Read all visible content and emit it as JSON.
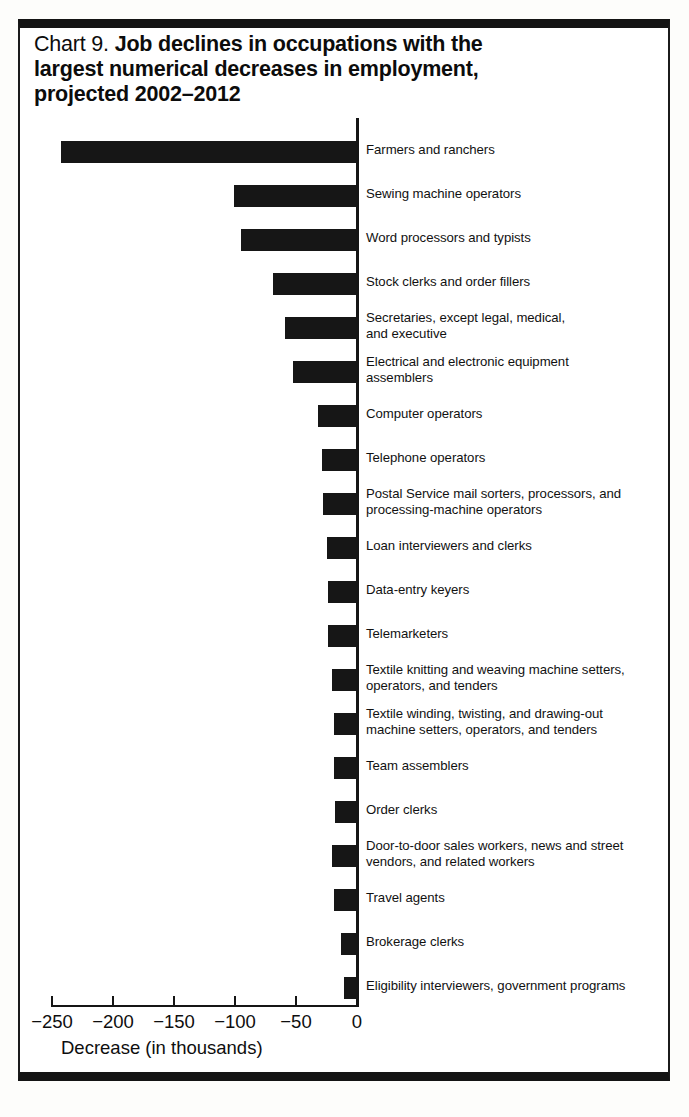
{
  "figure": {
    "title_prefix": "Chart 9.",
    "title_main_line1": "Job declines in occupations with the",
    "title_main_line2": "largest numerical decreases in employment,",
    "title_main_line3": "projected 2002–2012",
    "frame_color": "#141414",
    "bar_color": "#161616"
  },
  "chart_data": {
    "type": "bar",
    "orientation": "horizontal",
    "title": "Chart 9.  Job declines in occupations with the largest numerical decreases in employment, projected 2002–2012",
    "xlabel": "Decrease (in thousands)",
    "ylabel": "",
    "xlim": [
      -250,
      0
    ],
    "xticks": [
      -250,
      -200,
      -150,
      -100,
      -50,
      0
    ],
    "xticklabels": [
      "−250",
      "−200",
      "−150",
      "−100",
      "−50",
      "0"
    ],
    "grid": false,
    "legend": null,
    "units": "thousands of jobs",
    "categories": [
      "Farmers and ranchers",
      "Sewing machine operators",
      "Word processors and typists",
      "Stock clerks and order fillers",
      "Secretaries, except legal, medical,\nand executive",
      "Electrical and electronic equipment\nassemblers",
      "Computer operators",
      "Telephone operators",
      "Postal Service mail sorters, processors, and\nprocessing-machine operators",
      "Loan interviewers and clerks",
      "Data-entry keyers",
      "Telemarketers",
      "Textile knitting and weaving machine setters,\n operators, and tenders",
      "Textile winding, twisting, and drawing-out\nmachine setters, operators, and tenders",
      "Team assemblers",
      "Order clerks",
      "Door-to-door sales workers, news and street\nvendors, and related workers",
      "Travel agents",
      "Brokerage clerks",
      "Eligibility interviewers, government programs"
    ],
    "values": [
      -242,
      -100,
      -94,
      -68,
      -58,
      -52,
      -31,
      -28,
      -27,
      -24,
      -23,
      -23,
      -20,
      -18,
      -18,
      -17,
      -20,
      -18,
      -12,
      -10
    ]
  }
}
